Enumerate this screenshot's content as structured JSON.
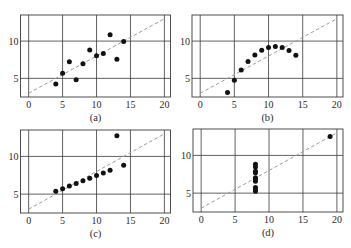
{
  "chart_data": [
    {
      "type": "scatter",
      "panel_label": "(a)",
      "title": "",
      "xlabel": "",
      "ylabel": "",
      "x": [
        10,
        8,
        13,
        9,
        11,
        14,
        6,
        4,
        12,
        7,
        5
      ],
      "y": [
        8.04,
        6.95,
        7.58,
        8.81,
        8.33,
        9.96,
        7.24,
        4.26,
        10.84,
        4.82,
        5.68
      ],
      "xlim": [
        -1.2,
        20.9
      ],
      "ylim": [
        2.5,
        13.5
      ],
      "xticks": [
        0,
        5,
        10,
        15,
        20
      ],
      "yticks": [
        5,
        10
      ],
      "grid": true,
      "fit_line": {
        "intercept": 3,
        "slope": 0.5,
        "style": "dashed",
        "color": "#9a9a9a"
      },
      "marker_color": "#111111"
    },
    {
      "type": "scatter",
      "panel_label": "(b)",
      "title": "",
      "xlabel": "",
      "ylabel": "",
      "x": [
        10,
        8,
        13,
        9,
        11,
        14,
        6,
        4,
        12,
        7,
        5
      ],
      "y": [
        9.14,
        8.14,
        8.74,
        8.77,
        9.26,
        8.1,
        6.13,
        3.1,
        9.13,
        7.26,
        4.74
      ],
      "xlim": [
        -1.2,
        20.9
      ],
      "ylim": [
        2.5,
        13.5
      ],
      "xticks": [
        0,
        5,
        10,
        15,
        20
      ],
      "yticks": [
        5,
        10
      ],
      "grid": true,
      "fit_line": {
        "intercept": 3,
        "slope": 0.5,
        "style": "dashed",
        "color": "#9a9a9a"
      },
      "marker_color": "#111111"
    },
    {
      "type": "scatter",
      "panel_label": "(c)",
      "title": "",
      "xlabel": "",
      "ylabel": "",
      "x": [
        10,
        8,
        13,
        9,
        11,
        14,
        6,
        4,
        12,
        7,
        5
      ],
      "y": [
        7.46,
        6.77,
        12.74,
        7.11,
        7.81,
        8.84,
        6.08,
        5.39,
        8.15,
        6.42,
        5.73
      ],
      "xlim": [
        -1.2,
        20.9
      ],
      "ylim": [
        2.5,
        13.5
      ],
      "xticks": [
        0,
        5,
        10,
        15,
        20
      ],
      "yticks": [
        5,
        10
      ],
      "grid": true,
      "fit_line": {
        "intercept": 3,
        "slope": 0.5,
        "style": "dashed",
        "color": "#9a9a9a"
      },
      "marker_color": "#111111"
    },
    {
      "type": "scatter",
      "panel_label": "(d)",
      "title": "",
      "xlabel": "",
      "ylabel": "",
      "x": [
        8,
        8,
        8,
        8,
        8,
        8,
        8,
        19,
        8,
        8,
        8
      ],
      "y": [
        6.58,
        5.76,
        7.71,
        8.84,
        8.47,
        7.04,
        5.25,
        12.5,
        5.56,
        7.91,
        6.89
      ],
      "xlim": [
        -1.2,
        20.9
      ],
      "ylim": [
        2.5,
        13.5
      ],
      "xticks": [
        0,
        5,
        10,
        15,
        20
      ],
      "yticks": [
        5,
        10
      ],
      "grid": true,
      "fit_line": {
        "intercept": 3,
        "slope": 0.5,
        "style": "dashed",
        "color": "#9a9a9a"
      },
      "marker_color": "#111111"
    }
  ]
}
